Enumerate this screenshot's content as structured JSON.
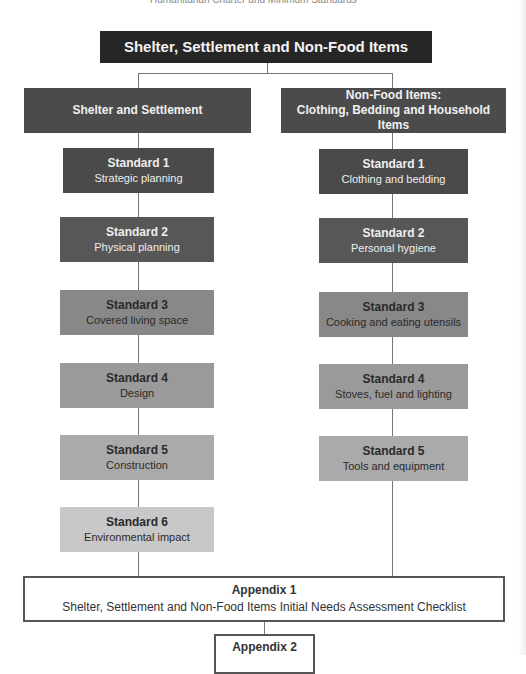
{
  "page_header": "Humanitarian Charter and Minimum Standards",
  "title": "Shelter, Settlement and Non-Food Items",
  "left_branch": {
    "title": "Shelter and Settlement",
    "standards": [
      {
        "label": "Standard 1",
        "name": "Strategic planning",
        "color": "#4a4a4a",
        "text_color": "#eeeeee"
      },
      {
        "label": "Standard 2",
        "name": "Physical planning",
        "color": "#5a5a5a",
        "text_color": "#eeeeee"
      },
      {
        "label": "Standard 3",
        "name": "Covered living space",
        "color": "#8a8a8a",
        "text_color": "#2a2a2a"
      },
      {
        "label": "Standard 4",
        "name": "Design",
        "color": "#9c9c9c",
        "text_color": "#2a2a2a"
      },
      {
        "label": "Standard 5",
        "name": "Construction",
        "color": "#ababab",
        "text_color": "#2a2a2a"
      },
      {
        "label": "Standard 6",
        "name": "Environmental impact",
        "color": "#c8c8c8",
        "text_color": "#2a2a2a"
      }
    ]
  },
  "right_branch": {
    "title_line1": "Non-Food Items:",
    "title_line2": "Clothing, Bedding and Household Items",
    "standards": [
      {
        "label": "Standard 1",
        "name": "Clothing and bedding",
        "color": "#4a4a4a",
        "text_color": "#eeeeee"
      },
      {
        "label": "Standard 2",
        "name": "Personal hygiene",
        "color": "#5a5a5a",
        "text_color": "#eeeeee"
      },
      {
        "label": "Standard 3",
        "name": "Cooking and eating utensils",
        "color": "#8a8a8a",
        "text_color": "#2a2a2a"
      },
      {
        "label": "Standard 4",
        "name": "Stoves, fuel and lighting",
        "color": "#9c9c9c",
        "text_color": "#2a2a2a"
      },
      {
        "label": "Standard 5",
        "name": "Tools and equipment",
        "color": "#ababab",
        "text_color": "#2a2a2a"
      }
    ]
  },
  "appendix1": {
    "label": "Appendix 1",
    "name": "Shelter, Settlement and Non-Food Items Initial Needs Assessment Checklist"
  },
  "appendix2": {
    "label": "Appendix 2"
  }
}
